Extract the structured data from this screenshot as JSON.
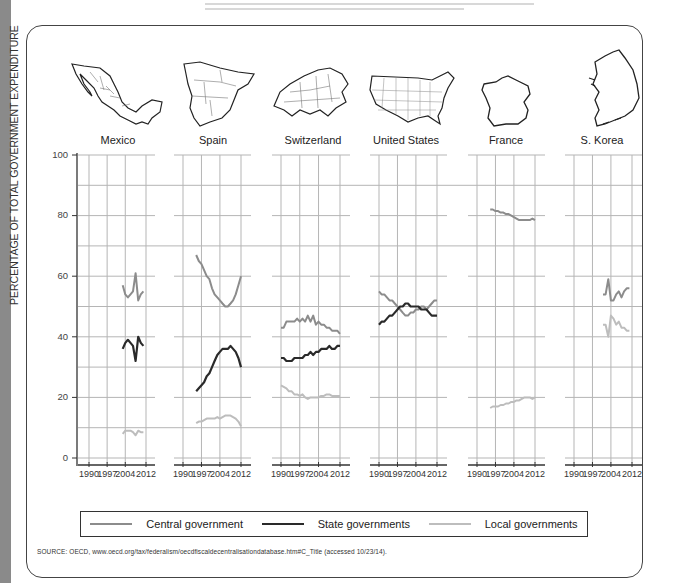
{
  "colors": {
    "central": "#8c8c8c",
    "state": "#2a2a2a",
    "local": "#bdbdbd",
    "grid": "#b5b5b5",
    "axis": "#333333"
  },
  "legend": {
    "central": "Central government",
    "state": "State governments",
    "local": "Local governments"
  },
  "source": "SOURCE: OECD, www.oecd.org/tax/federalism/oecdfiscaldecentralisationdatabase.htm#C_Title (accessed 10/23/14).",
  "y_axis": {
    "label": "PERCENTAGE  OF TOTAL GOVERNMENT EXPENDITURE",
    "ticks": [
      "100",
      "80",
      "60",
      "40",
      "20",
      "0"
    ]
  },
  "x_ticks": [
    "1990",
    "1997",
    "2004",
    "2012"
  ],
  "countries": [
    {
      "name": "Mexico",
      "map_icon": "mexico-map-icon"
    },
    {
      "name": "Spain",
      "map_icon": "spain-map-icon"
    },
    {
      "name": "Switzerland",
      "map_icon": "switzerland-map-icon"
    },
    {
      "name": "United States",
      "map_icon": "usa-map-icon"
    },
    {
      "name": "France",
      "map_icon": "france-map-icon"
    },
    {
      "name": "S. Korea",
      "map_icon": "south-korea-map-icon"
    }
  ],
  "chart_data": {
    "type": "line",
    "title": "",
    "ylabel": "PERCENTAGE OF TOTAL GOVERNMENT EXPENDITURE",
    "xlabel": "",
    "ylim": [
      0,
      100
    ],
    "xlim": [
      1990,
      2012
    ],
    "x_ticks": [
      1990,
      1997,
      2004,
      2012
    ],
    "y_ticks": [
      0,
      20,
      40,
      60,
      80,
      100
    ],
    "grid": true,
    "legend_position": "bottom",
    "legend": [
      "Central government",
      "State governments",
      "Local governments"
    ],
    "panels": [
      {
        "country": "Mexico",
        "series": [
          {
            "name": "Central government",
            "x": [
              2003,
              2004,
              2005,
              2006,
              2007,
              2008,
              2009,
              2010,
              2011
            ],
            "values": [
              57,
              54,
              53,
              54,
              55,
              61,
              52,
              54,
              55
            ]
          },
          {
            "name": "State governments",
            "x": [
              2003,
              2004,
              2005,
              2006,
              2007,
              2008,
              2009,
              2010,
              2011
            ],
            "values": [
              36,
              38,
              39,
              38,
              37,
              32,
              40,
              38,
              37
            ]
          },
          {
            "name": "Local governments",
            "x": [
              2003,
              2004,
              2005,
              2006,
              2007,
              2008,
              2009,
              2010,
              2011
            ],
            "values": [
              8,
              9,
              9,
              9,
              8.5,
              7.5,
              9,
              8.5,
              8.5
            ]
          }
        ]
      },
      {
        "country": "Spain",
        "series": [
          {
            "name": "Central government",
            "x": [
              1995,
              1996,
              1997,
              1998,
              1999,
              2000,
              2001,
              2002,
              2003,
              2004,
              2005,
              2006,
              2007,
              2008,
              2009,
              2010,
              2011,
              2012
            ],
            "values": [
              67,
              65,
              64,
              62,
              60,
              59,
              56,
              54,
              53,
              52,
              51,
              50,
              50,
              51,
              52,
              54,
              57,
              60
            ]
          },
          {
            "name": "State governments",
            "x": [
              1995,
              1996,
              1997,
              1998,
              1999,
              2000,
              2001,
              2002,
              2003,
              2004,
              2005,
              2006,
              2007,
              2008,
              2009,
              2010,
              2011,
              2012
            ],
            "values": [
              22,
              23,
              24,
              25,
              27,
              28,
              30,
              32,
              34,
              35,
              36,
              36,
              36,
              37,
              36,
              35,
              33,
              30
            ]
          },
          {
            "name": "Local governments",
            "x": [
              1995,
              1996,
              1997,
              1998,
              1999,
              2000,
              2001,
              2002,
              2003,
              2004,
              2005,
              2006,
              2007,
              2008,
              2009,
              2010,
              2011,
              2012
            ],
            "values": [
              11.5,
              12,
              12,
              12.5,
              13,
              13,
              13,
              13,
              13.5,
              13,
              13.5,
              14,
              14,
              14,
              13.5,
              13,
              12,
              10.5
            ]
          }
        ]
      },
      {
        "country": "Switzerland",
        "series": [
          {
            "name": "Central government",
            "x": [
              1990,
              1991,
              1992,
              1993,
              1994,
              1995,
              1996,
              1997,
              1998,
              1999,
              2000,
              2001,
              2002,
              2003,
              2004,
              2005,
              2006,
              2007,
              2008,
              2009,
              2010,
              2011,
              2012
            ],
            "values": [
              43,
              43,
              45,
              45,
              45,
              45,
              46,
              45,
              46,
              45,
              47,
              45,
              47,
              44,
              45,
              44,
              44,
              43,
              43,
              42,
              42,
              42,
              41
            ]
          },
          {
            "name": "State governments",
            "x": [
              1990,
              1991,
              1992,
              1993,
              1994,
              1995,
              1996,
              1997,
              1998,
              1999,
              2000,
              2001,
              2002,
              2003,
              2004,
              2005,
              2006,
              2007,
              2008,
              2009,
              2010,
              2011,
              2012
            ],
            "values": [
              33,
              33,
              32,
              32,
              32,
              33,
              33,
              33,
              33,
              34,
              34,
              35,
              34,
              35,
              35,
              36,
              36,
              36,
              37,
              36,
              36,
              37,
              37
            ]
          },
          {
            "name": "Local governments",
            "x": [
              1990,
              1991,
              1992,
              1993,
              1994,
              1995,
              1996,
              1997,
              1998,
              1999,
              2000,
              2001,
              2002,
              2003,
              2004,
              2005,
              2006,
              2007,
              2008,
              2009,
              2010,
              2011,
              2012
            ],
            "values": [
              24,
              23.5,
              23,
              22,
              22,
              21,
              21,
              20.5,
              21,
              20,
              19.5,
              20,
              20,
              20,
              20,
              20.5,
              20.5,
              21,
              21,
              20.5,
              20.5,
              20.5,
              20.5
            ]
          }
        ]
      },
      {
        "country": "United States",
        "series": [
          {
            "name": "Central government",
            "x": [
              1990,
              1991,
              1992,
              1993,
              1994,
              1995,
              1996,
              1997,
              1998,
              1999,
              2000,
              2001,
              2002,
              2003,
              2004,
              2005,
              2006,
              2007,
              2008,
              2009,
              2010,
              2011,
              2012
            ],
            "values": [
              55,
              54,
              54,
              53,
              52,
              52,
              51,
              50,
              49,
              48,
              47,
              47,
              48,
              48,
              49,
              49,
              50,
              50,
              49,
              50,
              51,
              52,
              52
            ]
          },
          {
            "name": "State governments",
            "x": [
              1990,
              1991,
              1992,
              1993,
              1994,
              1995,
              1996,
              1997,
              1998,
              1999,
              2000,
              2001,
              2002,
              2003,
              2004,
              2005,
              2006,
              2007,
              2008,
              2009,
              2010,
              2011,
              2012
            ],
            "values": [
              44,
              45,
              45,
              46,
              47,
              47,
              48,
              49,
              50,
              50,
              51,
              51,
              50,
              50,
              50,
              50,
              49,
              49,
              49,
              48,
              47,
              47,
              47
            ]
          }
        ]
      },
      {
        "country": "France",
        "series": [
          {
            "name": "Central government",
            "x": [
              1995,
              1996,
              1997,
              1998,
              1999,
              2000,
              2001,
              2002,
              2003,
              2004,
              2005,
              2006,
              2007,
              2008,
              2009,
              2010,
              2011,
              2012
            ],
            "values": [
              82,
              82,
              81.5,
              81.5,
              81,
              81,
              80.5,
              80.5,
              80,
              79.5,
              79,
              78.5,
              78.5,
              78.5,
              78.5,
              78.5,
              79,
              78.5
            ]
          },
          {
            "name": "Local governments",
            "x": [
              1995,
              1996,
              1997,
              1998,
              1999,
              2000,
              2001,
              2002,
              2003,
              2004,
              2005,
              2006,
              2007,
              2008,
              2009,
              2010,
              2011,
              2012
            ],
            "values": [
              16.5,
              17,
              17,
              17,
              17.5,
              17.5,
              18,
              18,
              18.5,
              18.5,
              19,
              19,
              19.5,
              20,
              20,
              20,
              19.5,
              20
            ]
          }
        ]
      },
      {
        "country": "S. Korea",
        "series": [
          {
            "name": "Central government",
            "x": [
              2001,
              2002,
              2003,
              2004,
              2005,
              2006,
              2007,
              2008,
              2009,
              2010,
              2011
            ],
            "values": [
              54,
              54,
              59,
              52,
              52,
              54,
              55,
              53,
              55,
              56,
              56
            ]
          },
          {
            "name": "Local governments",
            "x": [
              2001,
              2002,
              2003,
              2004,
              2005,
              2006,
              2007,
              2008,
              2009,
              2010,
              2011
            ],
            "values": [
              44,
              44,
              40,
              47,
              46,
              44,
              45,
              43,
              43,
              42,
              42
            ]
          }
        ]
      }
    ]
  }
}
